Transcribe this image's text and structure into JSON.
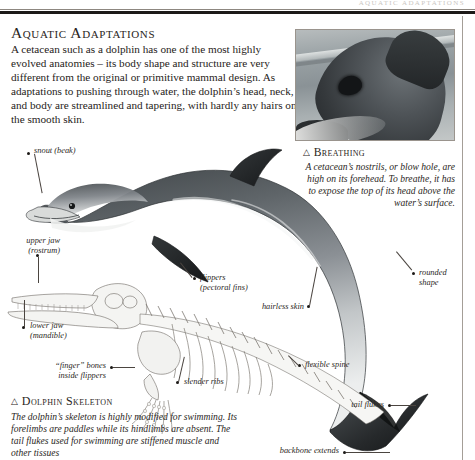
{
  "page": {
    "running_head": "AQUATIC ADAPTATIONS",
    "headline": "Aquatic Adaptations",
    "intro": "A cetacean such as a dolphin has one of the most highly evolved anatomies – its body shape and structure are very different from the original or primitive mammal design. As adaptations to pushing through water, the dolphin’s head, neck, and body are streamlined and tapering, with hardly any hairs on the smooth skin."
  },
  "captions": {
    "breathing": {
      "marker": "△",
      "title": "Breathing",
      "body": "A cetacean’s nostrils, or blow hole, are high on its forehead. To breathe, it has to expose the top of its head above the water’s surface."
    },
    "skeleton": {
      "marker": "△",
      "title": "Dolphin Skeleton",
      "body": "The dolphin’s skeleton is highly modified for swimming. Its forelimbs are paddles while its hindlimbs are absent. The tail flukes used for swimming are stiffened muscle and other tissues"
    }
  },
  "labels": {
    "snout": "snout (beak)",
    "upper_jaw": "upper jaw\n(rostrum)",
    "lower_jaw": "lower jaw\n(mandible)",
    "flippers": "flippers\n(pectoral fins)",
    "hairless_skin": "hairless skin",
    "rounded_shape": "rounded\nshape",
    "finger_bones": "“finger” bones\ninside flippers",
    "slender_ribs": "slender ribs",
    "flexible_spine": "flexible spine",
    "tail_flukes": "tail flukes",
    "backbone_extends": "backbone extends"
  },
  "figures": {
    "photo_alt": "dolphin head breaking water surface showing blowhole",
    "dolphin_alt": "grayscale illustration of a bottlenose dolphin",
    "skeleton_alt": "line drawing of a dolphin skeleton"
  },
  "colors": {
    "ink": "#231f1c",
    "rule": "#1d1a18",
    "paper": "#ffffff",
    "lead_line": "#4b4540"
  }
}
